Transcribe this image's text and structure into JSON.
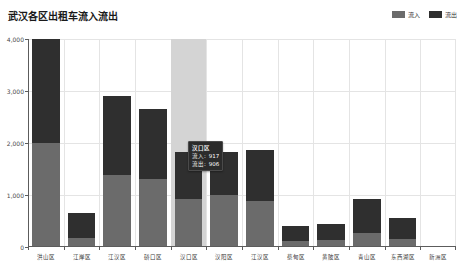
{
  "chart_data": {
    "type": "bar",
    "title": "武汉各区出租车流入流出",
    "xlabel": "",
    "ylabel": "",
    "ylim": [
      0,
      4000
    ],
    "yticks": [
      "0",
      "1,000",
      "2,000",
      "3,000",
      "4,000"
    ],
    "ytick_values": [
      0,
      1000,
      2000,
      3000,
      4000
    ],
    "grid": true,
    "stacked": true,
    "legend_position": "top-right",
    "categories": [
      "洪山区",
      "江岸区",
      "江汉区",
      "硚口区",
      "汉口区",
      "汉阳区",
      "江汉区",
      "蔡甸区",
      "黄陂区",
      "青山区",
      "东西湖区",
      "新洲区"
    ],
    "series": [
      {
        "name": "流入",
        "color": "#6b6b6b",
        "values": [
          2000,
          180,
          1380,
          1300,
          917,
          1000,
          880,
          120,
          130,
          260,
          160,
          0
        ]
      },
      {
        "name": "流出",
        "color": "#2f2f2f",
        "values": [
          2000,
          470,
          1520,
          1350,
          906,
          820,
          990,
          290,
          320,
          670,
          390,
          0
        ]
      }
    ],
    "totals": [
      4000,
      650,
      2900,
      2650,
      1823,
      1820,
      1870,
      410,
      450,
      930,
      550,
      0
    ],
    "highlighted_category_index": 4,
    "tooltip": {
      "title": "汉口区",
      "rows": [
        {
          "label": "流入:",
          "value": "917"
        },
        {
          "label": "流出:",
          "value": "906"
        }
      ]
    }
  },
  "legend": {
    "items": [
      {
        "label": "流入",
        "color": "#6b6b6b"
      },
      {
        "label": "流出",
        "color": "#2f2f2f"
      }
    ]
  }
}
